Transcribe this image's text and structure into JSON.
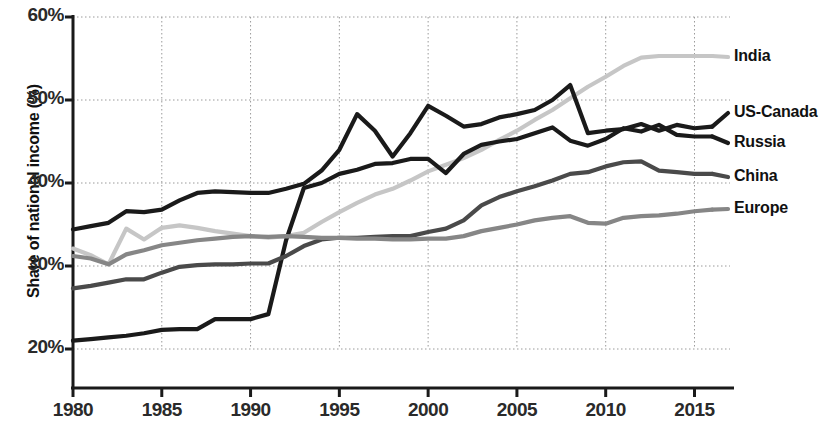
{
  "chart_data": {
    "type": "line",
    "title": "",
    "xlabel": "",
    "ylabel": "Share of national income (%)",
    "xlim": [
      1980,
      2017
    ],
    "ylim": [
      17,
      60
    ],
    "grid": true,
    "legend_position": "right-outside",
    "ytick_labels": [
      "60%",
      "50%",
      "40%",
      "30%",
      "20%"
    ],
    "ytick_values": [
      60,
      50,
      40,
      30,
      20
    ],
    "xtick_labels": [
      "1980",
      "1985",
      "1990",
      "1995",
      "2000",
      "2005",
      "2010",
      "2015"
    ],
    "xtick_values": [
      1980,
      1985,
      1990,
      1995,
      2000,
      2005,
      2010,
      2015
    ],
    "x": [
      1980,
      1981,
      1982,
      1983,
      1984,
      1985,
      1986,
      1987,
      1988,
      1989,
      1990,
      1991,
      1992,
      1993,
      1994,
      1995,
      1996,
      1997,
      1998,
      1999,
      2000,
      2001,
      2002,
      2003,
      2004,
      2005,
      2006,
      2007,
      2008,
      2009,
      2010,
      2011,
      2012,
      2013,
      2014,
      2015,
      2016
    ],
    "series": [
      {
        "name": "India",
        "color": "#c6c6c6",
        "label_y_px": 57,
        "values": [
          32.1,
          31.3,
          30.2,
          34.5,
          33.2,
          34.6,
          34.9,
          34.6,
          34.2,
          33.9,
          33.6,
          33.4,
          33.6,
          34.0,
          35.3,
          36.5,
          37.6,
          38.6,
          39.3,
          40.3,
          41.4,
          42.2,
          43.0,
          44.0,
          45.2,
          46.3,
          47.6,
          48.8,
          50.2,
          51.6,
          52.8,
          54.1,
          55.1,
          55.3,
          55.3,
          55.3,
          55.3
        ]
      },
      {
        "name": "US-Canada",
        "color": "#1a1a1a",
        "label_y_px": 113,
        "values": [
          34.4,
          34.8,
          35.2,
          36.6,
          36.5,
          36.8,
          37.9,
          38.8,
          39.0,
          38.9,
          38.8,
          38.8,
          39.3,
          39.9,
          41.5,
          44.0,
          48.3,
          46.3,
          43.2,
          46.0,
          49.3,
          48.1,
          46.8,
          47.1,
          47.9,
          48.3,
          48.8,
          50.0,
          51.8,
          46.0,
          46.3,
          46.5,
          47.1,
          46.3,
          47.0,
          46.6,
          46.8
        ]
      },
      {
        "name": "Russia",
        "color": "#1a1a1a",
        "label_y_px": 143,
        "values": [
          21.0,
          21.2,
          21.4,
          21.6,
          21.9,
          22.3,
          22.4,
          22.4,
          23.6,
          23.6,
          23.6,
          24.2,
          33.1,
          39.4,
          40.0,
          41.1,
          41.6,
          42.3,
          42.4,
          42.9,
          42.9,
          41.2,
          43.5,
          44.6,
          45.0,
          45.3,
          46.0,
          46.7,
          45.1,
          44.5,
          45.3,
          46.6,
          46.2,
          47.0,
          45.8,
          45.6,
          45.6
        ]
      },
      {
        "name": "China",
        "color": "#4a4a4a",
        "label_y_px": 177,
        "values": [
          27.3,
          27.6,
          28.0,
          28.4,
          28.4,
          29.2,
          29.9,
          30.1,
          30.2,
          30.2,
          30.3,
          30.3,
          31.2,
          32.4,
          33.2,
          33.4,
          33.4,
          33.5,
          33.6,
          33.6,
          34.1,
          34.5,
          35.5,
          37.3,
          38.3,
          39.0,
          39.6,
          40.3,
          41.1,
          41.3,
          42.0,
          42.5,
          42.6,
          41.5,
          41.3,
          41.1,
          41.1
        ]
      },
      {
        "name": "Europe",
        "color": "#868686",
        "label_y_px": 209,
        "values": [
          31.2,
          30.9,
          30.2,
          31.4,
          31.9,
          32.5,
          32.8,
          33.1,
          33.3,
          33.5,
          33.6,
          33.5,
          33.6,
          33.5,
          33.4,
          33.4,
          33.3,
          33.3,
          33.2,
          33.2,
          33.3,
          33.3,
          33.6,
          34.2,
          34.6,
          35.0,
          35.5,
          35.8,
          36.0,
          35.2,
          35.1,
          35.8,
          36.0,
          36.1,
          36.3,
          36.6,
          36.8
        ]
      }
    ]
  }
}
